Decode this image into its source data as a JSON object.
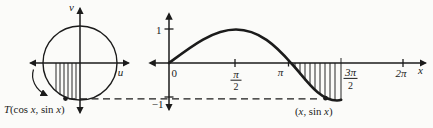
{
  "colors": {
    "ink": "#1b1b1b",
    "background": "#fbfbf9"
  },
  "unit_circle_panel": {
    "v_axis_label": "v",
    "u_axis_label": "u",
    "point_label_parts": {
      "t": "T",
      "open": "(cos ",
      "x1": "x",
      "comma_sin": ", sin ",
      "x2": "x",
      "close": ")"
    }
  },
  "sine_panel": {
    "origin_label": "0",
    "y_tick_top": "1",
    "y_tick_bottom": "−1",
    "tick_pi_half_num": "π",
    "tick_pi_half_den": "2",
    "tick_pi": "π",
    "tick_three_pi_half_num": "3π",
    "tick_three_pi_half_den": "2",
    "tick_two_pi": "2π",
    "x_axis_label": "x",
    "point_label_parts": {
      "open": "(",
      "x1": "x",
      "comma_sin": ", sin ",
      "x2": "x",
      "close": ")"
    }
  },
  "chart_data": {
    "type": "line",
    "panels": [
      {
        "name": "unit-circle",
        "axes": {
          "horizontal": "u",
          "vertical": "v"
        },
        "circle": {
          "center_uv": [
            0,
            0
          ],
          "radius": 1
        },
        "marked_point": {
          "label": "T(cos x, sin x)",
          "uv_approx": [
            -0.38,
            -0.95
          ]
        },
        "hatched_region": "vertical strips between u-axis and lower-left arc of the circle",
        "direction_arrow": "curved arrow outside lower-left of circle pointing toward T"
      },
      {
        "name": "sine-graph",
        "function": "y = sin x",
        "x_tick_labels": [
          "0",
          "π/2",
          "π",
          "3π/2",
          "2π"
        ],
        "y_tick_labels": [
          "1",
          "−1"
        ],
        "x_range_pi_units": [
          -0.18,
          2.17
        ],
        "y_range": [
          -1.35,
          1.35
        ],
        "curve_x_pi_units": [
          0,
          0.25,
          0.5,
          0.75,
          1,
          1.25,
          1.5
        ],
        "curve_y": [
          0,
          0.707,
          1,
          0.707,
          0,
          -0.707,
          -1
        ],
        "hatched_interval_pi_units": [
          1,
          1.5
        ],
        "marked_point": {
          "label": "(x, sin x)",
          "x_pi_units": 1.42,
          "y": -0.97
        }
      }
    ],
    "dashed_link": "horizontal dashed line near y = −1 joining T on the circle to (x, sin x) on the sine curve",
    "legend_position": "none",
    "grid": false
  }
}
